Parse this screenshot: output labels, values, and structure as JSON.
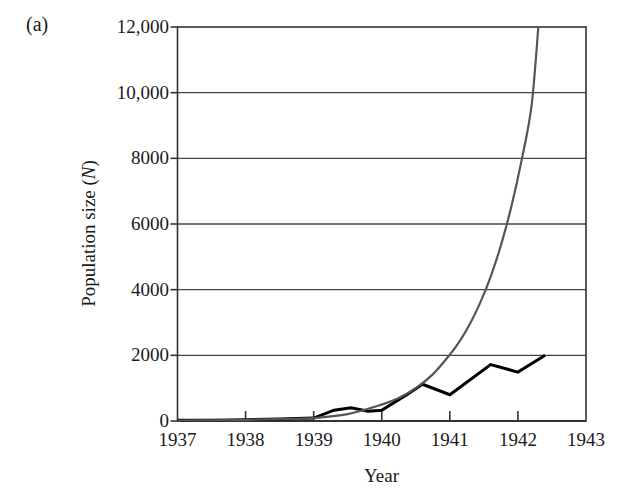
{
  "figure": {
    "panel_label": "(a)",
    "xlabel": "Year",
    "ylabel_prefix": "Population size (",
    "ylabel_symbol": "N",
    "ylabel_suffix": ")"
  },
  "colors": {
    "observed_line": "#000000",
    "model_line": "#555555",
    "axis": "#333333",
    "gridline": "#444444",
    "background": "#ffffff"
  },
  "chart_data": {
    "type": "line",
    "title": "",
    "subtitle": "",
    "panel": "(a)",
    "xlabel": "Year",
    "ylabel": "Population size (N)",
    "xlim": [
      1937,
      1943
    ],
    "ylim": [
      0,
      12000
    ],
    "xticks": [
      1937,
      1938,
      1939,
      1940,
      1941,
      1942,
      1943
    ],
    "xtick_labels": [
      "1937",
      "1938",
      "1939",
      "1940",
      "1941",
      "1942",
      "1943"
    ],
    "yticks": [
      0,
      2000,
      4000,
      6000,
      8000,
      10000,
      12000
    ],
    "ytick_labels": [
      "0",
      "2000",
      "4000",
      "6000",
      "8000",
      "10,000",
      "12,000"
    ],
    "grid": "horizontal",
    "legend": "none",
    "series": [
      {
        "name": "Observed population size",
        "color": "#000000",
        "style": "solid-thick",
        "x": [
          1937.0,
          1937.5,
          1938.0,
          1938.5,
          1939.0,
          1939.3,
          1939.55,
          1939.8,
          1940.0,
          1940.35,
          1940.6,
          1941.0,
          1941.6,
          1942.0,
          1942.4
        ],
        "y": [
          20,
          25,
          40,
          60,
          90,
          330,
          400,
          300,
          330,
          780,
          1120,
          800,
          1720,
          1490,
          2000
        ]
      },
      {
        "name": "Exponential growth model",
        "color": "#555555",
        "style": "solid-smooth",
        "x": [
          1937.0,
          1937.5,
          1938.0,
          1938.5,
          1939.0,
          1939.5,
          1940.0,
          1940.25,
          1940.5,
          1940.75,
          1941.0,
          1941.15,
          1941.3,
          1941.45,
          1941.6,
          1941.75,
          1941.9,
          1942.05,
          1942.2,
          1942.3
        ],
        "y": [
          15,
          22,
          35,
          55,
          90,
          210,
          500,
          700,
          1000,
          1420,
          2020,
          2450,
          2980,
          3620,
          4400,
          5350,
          6500,
          7900,
          9600,
          12000
        ]
      }
    ],
    "annotations": []
  }
}
